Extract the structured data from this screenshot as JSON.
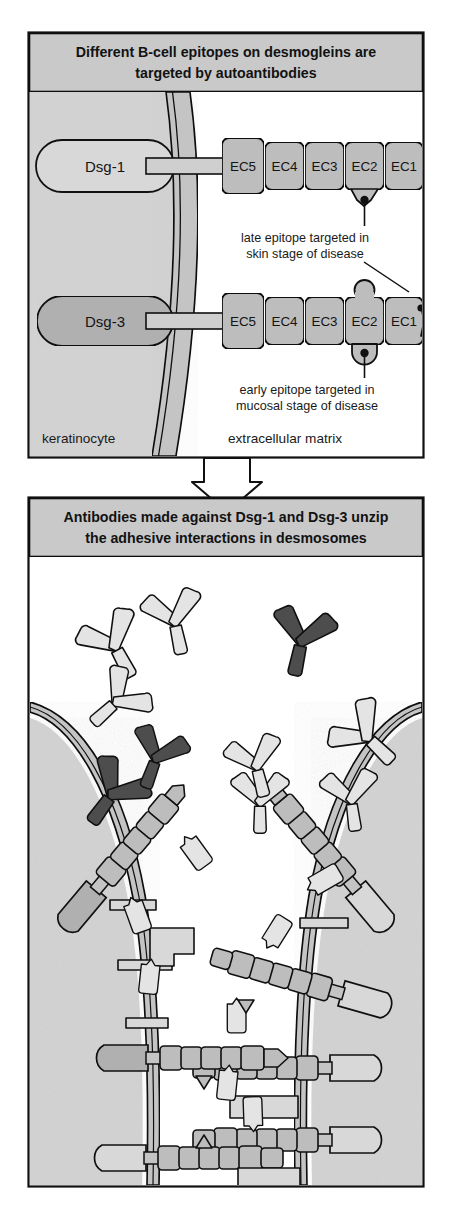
{
  "figure": {
    "type": "scientific-diagram",
    "background_color": "#ffffff"
  },
  "colors": {
    "panel_fill": "#ffffff",
    "header_fill": "#c9c9c9",
    "cytoplasm_fill": "#d2d2d2",
    "membrane_fill": "#c4c4c4",
    "ec_domain_fill": "#bdbdbd",
    "dsg1_fill": "#d8d8d8",
    "dsg3_fill": "#b0b0b0",
    "antibody_light": "#e3e3e3",
    "antibody_mid": "#c6c6c6",
    "antibody_dark": "#4d4d4d",
    "outline": "#101010"
  },
  "panel1": {
    "title_line1": "Different B-cell epitopes on desmogleins are",
    "title_line2": "targeted by autoantibodies",
    "molecules": [
      {
        "name": "Dsg-1",
        "fill": "#d8d8d8",
        "domains": [
          "EC5",
          "EC4",
          "EC3",
          "EC2",
          "EC1"
        ],
        "epitope_domain": "EC2",
        "epitope_position": "below"
      },
      {
        "name": "Dsg-3",
        "fill": "#b0b0b0",
        "domains": [
          "EC5",
          "EC4",
          "EC3",
          "EC2",
          "EC1"
        ],
        "epitope_domain": "EC2",
        "epitope_position": "both"
      }
    ],
    "annotations": [
      {
        "id": "late-epitope",
        "line1": "late epitope targeted in",
        "line2": "skin stage of disease"
      },
      {
        "id": "early-epitope",
        "line1": "early epitope targeted in",
        "line2": "mucosal stage of disease"
      }
    ],
    "zone_labels": {
      "left": "keratinocyte",
      "right": "extracellular matrix"
    }
  },
  "connector": {
    "icon": "down-arrow"
  },
  "panel2": {
    "title_line1": "Antibodies made against Dsg-1 and Dsg-3 unzip",
    "title_line2": "the adhesive interactions in desmosomes",
    "legend_note": "",
    "antibodies": [
      {
        "id": "ab-1",
        "x": 118,
        "y": 652,
        "rot": -28,
        "shade": "light",
        "scale": 1.0
      },
      {
        "id": "ab-2",
        "x": 112,
        "y": 706,
        "rot": 48,
        "shade": "light",
        "scale": 0.92
      },
      {
        "id": "ab-3",
        "x": 300,
        "y": 648,
        "rot": 12,
        "shade": "dark",
        "scale": 1.0
      },
      {
        "id": "ab-4",
        "x": 176,
        "y": 628,
        "rot": -12,
        "shade": "light",
        "scale": 0.95
      },
      {
        "id": "ab-5",
        "x": 108,
        "y": 800,
        "rot": 36,
        "shade": "dark",
        "scale": 1.0
      },
      {
        "id": "ab-6",
        "x": 260,
        "y": 808,
        "rot": 0,
        "shade": "light",
        "scale": 0.9
      },
      {
        "id": "ab-7",
        "x": 372,
        "y": 742,
        "rot": -46,
        "shade": "light",
        "scale": 1.0
      },
      {
        "id": "ab-8",
        "x": 352,
        "y": 806,
        "rot": -8,
        "shade": "light",
        "scale": 0.9
      },
      {
        "id": "ab-9",
        "x": 154,
        "y": 764,
        "rot": 20,
        "shade": "dark",
        "scale": 0.9
      },
      {
        "id": "ab-10",
        "x": 258,
        "y": 772,
        "rot": -14,
        "shade": "light",
        "scale": 0.9
      },
      {
        "id": "ab-11",
        "x": 196,
        "y": 836,
        "rot": 54,
        "shade": "light",
        "scale": 0.88
      },
      {
        "id": "ab-12",
        "x": 308,
        "y": 878,
        "rot": -30,
        "shade": "light",
        "scale": 0.9
      },
      {
        "id": "ab-13",
        "x": 142,
        "y": 900,
        "rot": 70,
        "shade": "light",
        "scale": 0.88
      },
      {
        "id": "ab-14",
        "x": 262,
        "y": 938,
        "rot": -58,
        "shade": "light",
        "scale": 0.85
      },
      {
        "id": "ab-15",
        "x": 160,
        "y": 966,
        "rot": 96,
        "shade": "light",
        "scale": 0.85
      },
      {
        "id": "ab-16",
        "x": 246,
        "y": 1004,
        "rot": 90,
        "shade": "light",
        "scale": 0.85
      },
      {
        "id": "ab-17",
        "x": 238,
        "y": 1072,
        "rot": 96,
        "shade": "light",
        "scale": 0.85
      },
      {
        "id": "ab-18",
        "x": 244,
        "y": 1126,
        "rot": 268,
        "shade": "light",
        "scale": 0.85
      }
    ],
    "desmoglein_chains": [
      {
        "id": "chain-left-upper",
        "domains": 5,
        "state": "detached"
      },
      {
        "id": "chain-right-upper",
        "domains": 5,
        "state": "detached"
      },
      {
        "id": "chain-right-mid",
        "domains": 5,
        "state": "detached"
      },
      {
        "id": "chain-mid-1",
        "domains": 5,
        "state": "detached"
      },
      {
        "id": "chain-mid-2",
        "domains": 5,
        "state": "detached"
      },
      {
        "id": "chain-mid-3",
        "domains": 5,
        "state": "detached"
      },
      {
        "id": "chain-mid-4",
        "domains": 5,
        "state": "detached"
      }
    ]
  }
}
